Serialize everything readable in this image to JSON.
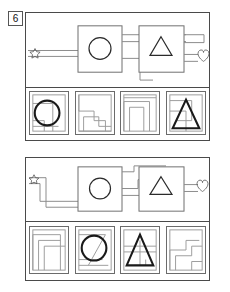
{
  "page": {
    "kind": "visual-reasoning-worksheet",
    "background_color": "#ffffff",
    "line_color": "#8c8c8c",
    "ink_color": "#2b2b2b"
  },
  "question_number": "6",
  "puzzles": [
    {
      "id": "puzzle-1",
      "stem": {
        "input_icon": "star-icon",
        "output_icon": "heart-icon",
        "gates": [
          {
            "name": "gate-circle",
            "glyph": "circle-icon"
          },
          {
            "name": "gate-triangle",
            "glyph": "triangle-icon"
          }
        ],
        "wire_count": "5"
      },
      "options": [
        {
          "label": "A",
          "name": "option-circle-overlay",
          "glyph": "circle-icon"
        },
        {
          "label": "B",
          "name": "option-zigzag-path",
          "glyph": "staircase-path-icon"
        },
        {
          "label": "C",
          "name": "option-bracket-path",
          "glyph": "bracket-path-icon"
        },
        {
          "label": "D",
          "name": "option-triangle-overlay",
          "glyph": "triangle-icon"
        }
      ]
    },
    {
      "id": "puzzle-2",
      "stem": {
        "input_icon": "star-icon",
        "output_icon": "heart-icon",
        "gates": [
          {
            "name": "gate-circle",
            "glyph": "circle-icon"
          },
          {
            "name": "gate-triangle",
            "glyph": "triangle-icon"
          }
        ],
        "wire_count": "5"
      },
      "options": [
        {
          "label": "A",
          "name": "option-nested-corner",
          "glyph": "nested-corner-icon"
        },
        {
          "label": "B",
          "name": "option-circle-slash",
          "glyph": "circle-slash-icon"
        },
        {
          "label": "C",
          "name": "option-triangle-lines",
          "glyph": "triangle-icon"
        },
        {
          "label": "D",
          "name": "option-step-path",
          "glyph": "step-path-icon"
        }
      ]
    }
  ]
}
